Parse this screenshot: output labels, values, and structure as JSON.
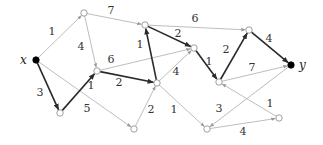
{
  "diagram": {
    "type": "directed-weighted-graph",
    "colors": {
      "thin_edge": "#b5b5b5",
      "bold_edge": "#2a2a2a",
      "node_fill": "#ffffff",
      "terminal_fill": "#000000"
    },
    "nodes": [
      {
        "id": "x",
        "x": 36,
        "y": 60,
        "terminal": true,
        "label": "x",
        "lx": 20,
        "ly": 64
      },
      {
        "id": "a",
        "x": 84,
        "y": 13
      },
      {
        "id": "b",
        "x": 145,
        "y": 25
      },
      {
        "id": "c",
        "x": 97,
        "y": 71
      },
      {
        "id": "d",
        "x": 60,
        "y": 113
      },
      {
        "id": "e",
        "x": 157,
        "y": 83
      },
      {
        "id": "f",
        "x": 194,
        "y": 48
      },
      {
        "id": "g",
        "x": 134,
        "y": 129
      },
      {
        "id": "h",
        "x": 207,
        "y": 129
      },
      {
        "id": "i",
        "x": 249,
        "y": 30
      },
      {
        "id": "j",
        "x": 219,
        "y": 82
      },
      {
        "id": "y",
        "x": 291,
        "y": 65,
        "terminal": true,
        "label": "y",
        "lx": 299,
        "ly": 69
      },
      {
        "id": "k",
        "x": 279,
        "y": 118
      }
    ],
    "edges": [
      {
        "from": "x",
        "to": "a",
        "w": "1",
        "bold": false,
        "lx": 52,
        "ly": 35
      },
      {
        "from": "x",
        "to": "d",
        "w": "3",
        "bold": true,
        "lx": 40,
        "ly": 96
      },
      {
        "from": "x",
        "to": "g",
        "w": "5",
        "bold": false,
        "lx": 87,
        "ly": 112
      },
      {
        "from": "a",
        "to": "b",
        "w": "7",
        "bold": false,
        "lx": 111,
        "ly": 14
      },
      {
        "from": "a",
        "to": "c",
        "w": "4",
        "bold": false,
        "lx": 81,
        "ly": 50
      },
      {
        "from": "d",
        "to": "c",
        "w": "1",
        "bold": true,
        "lx": 91,
        "ly": 89
      },
      {
        "from": "c",
        "to": "e",
        "w": "2",
        "bold": true,
        "lx": 119,
        "ly": 86
      },
      {
        "from": "c",
        "to": "f",
        "w": "6",
        "bold": false,
        "lx": 111,
        "ly": 63
      },
      {
        "from": "e",
        "to": "b",
        "w": "1",
        "bold": true,
        "lx": 140,
        "ly": 48
      },
      {
        "from": "b",
        "to": "f",
        "w": "2",
        "bold": true,
        "lx": 178,
        "ly": 37
      },
      {
        "from": "g",
        "to": "e",
        "w": "2",
        "bold": false,
        "lx": 151,
        "ly": 113
      },
      {
        "from": "e",
        "to": "f",
        "w": "4",
        "bold": false,
        "lx": 176,
        "ly": 75
      },
      {
        "from": "e",
        "to": "h",
        "w": "1",
        "bold": false,
        "lx": 174,
        "ly": 113
      },
      {
        "from": "b",
        "to": "i",
        "w": "6",
        "bold": false,
        "lx": 195,
        "ly": 22
      },
      {
        "from": "f",
        "to": "j",
        "w": "1",
        "bold": true,
        "lx": 209,
        "ly": 65
      },
      {
        "from": "j",
        "to": "i",
        "w": "2",
        "bold": true,
        "lx": 226,
        "ly": 53
      },
      {
        "from": "i",
        "to": "y",
        "w": "4",
        "bold": true,
        "lx": 269,
        "ly": 42
      },
      {
        "from": "j",
        "to": "y",
        "w": "7",
        "bold": false,
        "lx": 252,
        "ly": 71
      },
      {
        "from": "k",
        "to": "j",
        "w": "1",
        "bold": false,
        "lx": 270,
        "ly": 107
      },
      {
        "from": "y",
        "to": "h",
        "w": "3",
        "bold": false,
        "lx": 219,
        "ly": 112
      },
      {
        "from": "h",
        "to": "k",
        "w": "4",
        "bold": false,
        "lx": 243,
        "ly": 135
      }
    ]
  }
}
